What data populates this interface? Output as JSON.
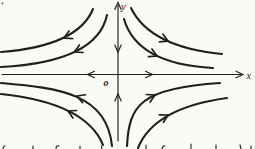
{
  "figure": {
    "labels": {
      "x_axis": "x",
      "y_axis": "y",
      "origin": "o"
    },
    "colors": {
      "ink": "#211f1c",
      "paper": "#fbfaf6"
    },
    "axes": {
      "x": {
        "x1": 2,
        "y1": 74.5,
        "x2": 240.5,
        "y2": 74.5
      },
      "y": {
        "x1": 118,
        "y1": 5,
        "x2": 118,
        "y2": 141
      }
    },
    "axis_arrowheads": [
      {
        "name": "x-axis-tip-arrowhead",
        "x": 243,
        "y": 74.5,
        "angle": 0
      },
      {
        "name": "x-axis-flow-right-arrowhead",
        "x": 152.5,
        "y": 74.5,
        "angle": 0
      },
      {
        "name": "x-axis-flow-left-arrowhead",
        "x": 87.5,
        "y": 74.5,
        "angle": 180
      },
      {
        "name": "y-axis-tip-arrowhead",
        "x": 118,
        "y": 2.5,
        "angle": -90
      },
      {
        "name": "y-axis-flow-down-arrowhead",
        "x": 118,
        "y": 52,
        "angle": 90
      },
      {
        "name": "y-axis-flow-up-arrowhead",
        "x": 118,
        "y": 94,
        "angle": -90
      }
    ],
    "trajectories": [
      {
        "name": "upper-left-outer",
        "path": "M 93,9 Q 78,46 1,52",
        "arrow": {
          "x": 64,
          "y": 38,
          "angle": 155
        }
      },
      {
        "name": "upper-left-inner",
        "path": "M 107,15 Q 97,62 1,67",
        "arrow": {
          "x": 74.5,
          "y": 52,
          "angle": 154
        }
      },
      {
        "name": "upper-right-outer",
        "path": "M 131,8 Q 150,47 222,54",
        "arrow": {
          "x": 168,
          "y": 41,
          "angle": 24
        }
      },
      {
        "name": "upper-right-inner",
        "path": "M 124,19 Q 137,64 213,68",
        "arrow": {
          "x": 157,
          "y": 56,
          "angle": 25
        }
      },
      {
        "name": "lower-left-outer",
        "path": "M 1,94 Q 86,103 103,145",
        "arrow": {
          "x": 68,
          "y": 111,
          "angle": 206
        }
      },
      {
        "name": "lower-left-inner",
        "path": "M 1,83 C 60,88 107,94 112,146",
        "arrow": {
          "x": 77,
          "y": 96,
          "angle": 201
        }
      },
      {
        "name": "lower-right-outer",
        "path": "M 138,148 Q 154,108 227,98",
        "arrow": {
          "x": 168,
          "y": 115,
          "angle": -29
        }
      },
      {
        "name": "lower-right-inner",
        "path": "M 127,146 C 129,105 141,88 220,83",
        "arrow": {
          "x": 155,
          "y": 95,
          "angle": -26
        }
      }
    ],
    "arrowhead_shapes": {
      "axis": "M -7,-3.2 L 0,0 L -7,3.2",
      "flow": "M -7.5,-4.2 L 0,0 L -7.5,4.2"
    },
    "label_positions": {
      "y": {
        "x": 121,
        "y": 10
      },
      "x": {
        "x": 246.5,
        "y": 78.5
      },
      "o": {
        "x": 103.5,
        "y": 86
      }
    },
    "print_artifacts": {
      "corner_speck": {
        "x": 2.5,
        "y": 3.5
      },
      "cropped_text_marks": [
        {
          "x": 3,
          "y": 146,
          "d": "M0,3 Q0,0 2,0"
        },
        {
          "x": 32,
          "y": 146,
          "d": "M1,3 L1,0"
        },
        {
          "x": 56,
          "y": 145,
          "d": "M0,4 Q0,0 3,1"
        },
        {
          "x": 79,
          "y": 146,
          "d": "M1,3 L1,0"
        },
        {
          "x": 101,
          "y": 146,
          "d": "M1,3 L0.5,0"
        },
        {
          "x": 145,
          "y": 145,
          "d": "M1,4 L1,0"
        },
        {
          "x": 162,
          "y": 145,
          "d": "M0,4 Q1,0 3,1"
        },
        {
          "x": 190,
          "y": 144,
          "d": "M1,5 L1,0"
        },
        {
          "x": 215,
          "y": 145,
          "d": "M1,4 L1,0"
        },
        {
          "x": 240,
          "y": 145,
          "d": "M1,4 L0,0"
        },
        {
          "x": 250,
          "y": 146,
          "d": "M1,3 L1,0"
        }
      ]
    }
  }
}
